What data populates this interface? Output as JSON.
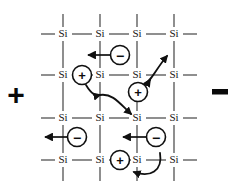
{
  "figure": {
    "background_color": "#ffffff",
    "bond_color": "#3c3c3c",
    "ink_color": "#101010"
  },
  "terminals": [
    {
      "id": "anode",
      "label": "+",
      "name": "positive-terminal",
      "x": 16,
      "y": 94
    },
    {
      "id": "cathode",
      "label": "−",
      "name": "negative-terminal",
      "x": 220,
      "y": 94
    }
  ],
  "lattice": {
    "atom_label": "Si",
    "columns_x": [
      63,
      100,
      137,
      174
    ],
    "rows_y": [
      34,
      75,
      118,
      160
    ],
    "atoms": [
      {
        "label": "Si",
        "x": 63,
        "y": 34
      },
      {
        "label": "Si",
        "x": 100,
        "y": 34
      },
      {
        "label": "Si",
        "x": 137,
        "y": 34
      },
      {
        "label": "Si",
        "x": 174,
        "y": 34
      },
      {
        "label": "Si",
        "x": 63,
        "y": 75
      },
      {
        "label": "Si",
        "x": 100,
        "y": 75
      },
      {
        "label": "Si",
        "x": 137,
        "y": 75
      },
      {
        "label": "Si",
        "x": 174,
        "y": 75
      },
      {
        "label": "Si",
        "x": 63,
        "y": 118
      },
      {
        "label": "Si",
        "x": 100,
        "y": 118
      },
      {
        "label": "Si",
        "x": 137,
        "y": 118
      },
      {
        "label": "Si",
        "x": 174,
        "y": 118
      },
      {
        "label": "Si",
        "x": 63,
        "y": 160
      },
      {
        "label": "Si",
        "x": 100,
        "y": 160
      },
      {
        "label": "Si",
        "x": 137,
        "y": 160
      },
      {
        "label": "Si",
        "x": 174,
        "y": 160
      }
    ]
  },
  "carriers": [
    {
      "id": "hole-1",
      "sign": "+",
      "x": 82,
      "y": 75,
      "r": 9.5,
      "name": "hole-carrier"
    },
    {
      "id": "hole-2",
      "sign": "+",
      "x": 138,
      "y": 92,
      "r": 9.5,
      "name": "hole-carrier"
    },
    {
      "id": "hole-3",
      "sign": "+",
      "x": 120,
      "y": 160,
      "r": 9.5,
      "name": "hole-carrier"
    },
    {
      "id": "electron-1",
      "sign": "−",
      "x": 120,
      "y": 55,
      "r": 9.5,
      "name": "electron-carrier"
    },
    {
      "id": "electron-2",
      "sign": "−",
      "x": 77,
      "y": 137,
      "r": 9.5,
      "name": "electron-carrier"
    },
    {
      "id": "electron-3",
      "sign": "−",
      "x": 156,
      "y": 137,
      "r": 9.5,
      "name": "electron-carrier"
    }
  ],
  "arrows": {
    "electron_drift_direction": "left",
    "hole_drift_direction": "right",
    "straight": [
      {
        "id": "e1-path",
        "from_x": 111,
        "to_x": 87,
        "y": 55,
        "name": "electron-drift-arrow"
      },
      {
        "id": "e2-path",
        "from_x": 68,
        "to_x": 44,
        "y": 137,
        "name": "electron-drift-arrow"
      },
      {
        "id": "e3-path",
        "from_x": 147,
        "to_x": 122,
        "y": 137,
        "name": "electron-drift-arrow"
      }
    ],
    "curved": [
      {
        "id": "h1-path",
        "name": "hole-hop-arrow",
        "d": "M 85 85 C 90 95 95 96 100 95"
      },
      {
        "id": "h1b-path",
        "name": "hole-hop-arrow",
        "d": "M 100 95 C 112 94 120 104 130 113"
      },
      {
        "id": "h2-path",
        "name": "hole-hop-arrow",
        "d": "M 145 86 C 154 80 157 70 167 57"
      },
      {
        "id": "h3-path",
        "name": "hole-hop-arrow",
        "d": "M 159 154 C 160 170 148 176 135 173"
      }
    ]
  },
  "legend": {
    "hole_symbol": "+",
    "electron_symbol": "−"
  }
}
